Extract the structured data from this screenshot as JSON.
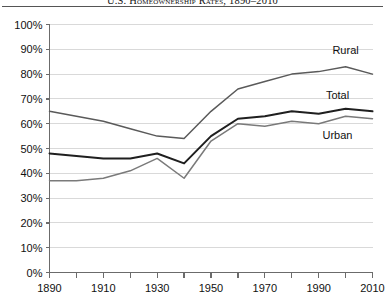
{
  "chart_data": {
    "type": "line",
    "title": "U.S. Homeownership Rates, 1890–2010",
    "xlabel": "",
    "ylabel": "",
    "xlim": [
      1890,
      2010
    ],
    "ylim": [
      0,
      100
    ],
    "grid": true,
    "legend_position": "inline-right",
    "x": [
      1890,
      1900,
      1910,
      1920,
      1930,
      1940,
      1950,
      1960,
      1970,
      1980,
      1990,
      2000,
      2010
    ],
    "y_ticks": [
      0,
      10,
      20,
      30,
      40,
      50,
      60,
      70,
      80,
      90,
      100
    ],
    "y_tick_labels": [
      "0%",
      "10%",
      "20%",
      "30%",
      "40%",
      "50%",
      "60%",
      "70%",
      "80%",
      "90%",
      "100%"
    ],
    "x_ticks": [
      1890,
      1900,
      1910,
      1920,
      1930,
      1940,
      1950,
      1960,
      1970,
      1980,
      1990,
      2000,
      2010
    ],
    "x_tick_labels": [
      "1890",
      "",
      "1910",
      "",
      "1930",
      "",
      "1950",
      "",
      "1970",
      "",
      "1990",
      "",
      "2010"
    ],
    "series": [
      {
        "name": "Rural",
        "color": "#5a5a5a",
        "width": 1.5,
        "label_x": 2000,
        "label_y": 88,
        "values": [
          65,
          63,
          61,
          58,
          55,
          54,
          65,
          74,
          77,
          80,
          81,
          83,
          80
        ]
      },
      {
        "name": "Total",
        "color": "#1f1f1f",
        "width": 2.0,
        "label_x": 1997,
        "label_y": 70,
        "values": [
          48,
          47,
          46,
          46,
          48,
          44,
          55,
          62,
          63,
          65,
          64,
          66,
          65
        ]
      },
      {
        "name": "Urban",
        "color": "#7a7a7a",
        "width": 1.5,
        "label_x": 1997,
        "label_y": 54,
        "values": [
          37,
          37,
          38,
          41,
          46,
          38,
          53,
          60,
          59,
          61,
          60,
          63,
          62
        ]
      }
    ]
  },
  "axis": {
    "y_axis_name": "percent-axis",
    "x_axis_name": "year-axis"
  }
}
